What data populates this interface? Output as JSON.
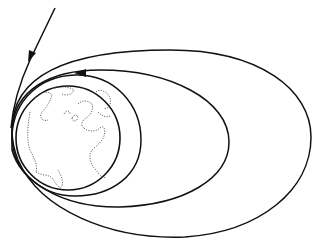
{
  "diagram": {
    "type": "orbital-trajectory-diagram",
    "colors": {
      "line": "#111111",
      "background": "#ffffff",
      "coastline": "#444444"
    },
    "elements": [
      {
        "name": "incoming-trajectory",
        "arrow": "down-left"
      },
      {
        "name": "outer-elliptical-orbit"
      },
      {
        "name": "middle-elliptical-orbit",
        "arrow": "left"
      },
      {
        "name": "inner-orbit"
      },
      {
        "name": "earth-globe",
        "content": "Atlantic view with dotted coastlines of the Americas, Europe and Africa"
      }
    ]
  }
}
